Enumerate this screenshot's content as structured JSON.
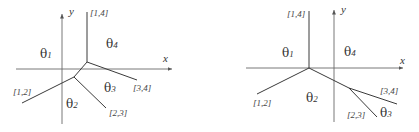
{
  "diagrams": [
    {
      "id": "left",
      "axes": {
        "x_label": "x",
        "y_label": "y"
      },
      "edge_labels": [
        "[1,4]",
        "[1,2]",
        "[2,3]",
        "[3,4]"
      ],
      "regions": [
        {
          "symbol": "θ",
          "sub": "1"
        },
        {
          "symbol": "θ",
          "sub": "2"
        },
        {
          "symbol": "θ",
          "sub": "3"
        },
        {
          "symbol": "θ",
          "sub": "4"
        }
      ]
    },
    {
      "id": "right",
      "axes": {
        "x_label": "x",
        "y_label": "y"
      },
      "edge_labels": [
        "[1,4]",
        "[1,2]",
        "[2,3]",
        "[3,4]"
      ],
      "regions": [
        {
          "symbol": "θ",
          "sub": "1"
        },
        {
          "symbol": "θ",
          "sub": "2"
        },
        {
          "symbol": "θ",
          "sub": "3"
        },
        {
          "symbol": "θ",
          "sub": "4"
        }
      ]
    }
  ],
  "colors": {
    "line": "#3a3a3a",
    "axis": "#6a6a6a",
    "text": "#333333"
  }
}
